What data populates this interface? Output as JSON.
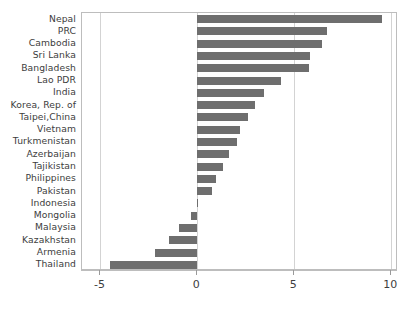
{
  "chart_data": {
    "type": "bar",
    "orientation": "horizontal",
    "title": "",
    "subtitle": "",
    "xlabel": "",
    "ylabel": "",
    "xlim": [
      -5.95,
      10.35
    ],
    "ylim": null,
    "grid": true,
    "grid_axis": "x",
    "legend": null,
    "legend_position": "none",
    "bar_color": "#6e6e6e",
    "axis_color": "#bdbdbd",
    "gridline_color": "#d3d3d3",
    "text_color": "#3d3d3d",
    "background": "#ffffff",
    "xticks": [
      -5,
      0,
      5,
      10
    ],
    "xtick_labels": [
      "-5",
      "0",
      "5",
      "10"
    ],
    "categories": [
      "Nepal",
      "PRC",
      "Cambodia",
      "Sri Lanka",
      "Bangladesh",
      "Lao PDR",
      "India",
      "Korea, Rep. of",
      "Taipei,China",
      "Vietnam",
      "Turkmenistan",
      "Azerbaijan",
      "Tajikistan",
      "Philippines",
      "Pakistan",
      "Indonesia",
      "Mongolia",
      "Malaysia",
      "Kazakhstan",
      "Armenia",
      "Thailand"
    ],
    "values": [
      9.55,
      6.7,
      6.45,
      5.8,
      5.75,
      4.3,
      3.45,
      2.95,
      2.6,
      2.2,
      2.05,
      1.65,
      1.3,
      0.95,
      0.75,
      0.05,
      -0.35,
      -0.95,
      -1.45,
      -2.2,
      -4.5
    ]
  }
}
